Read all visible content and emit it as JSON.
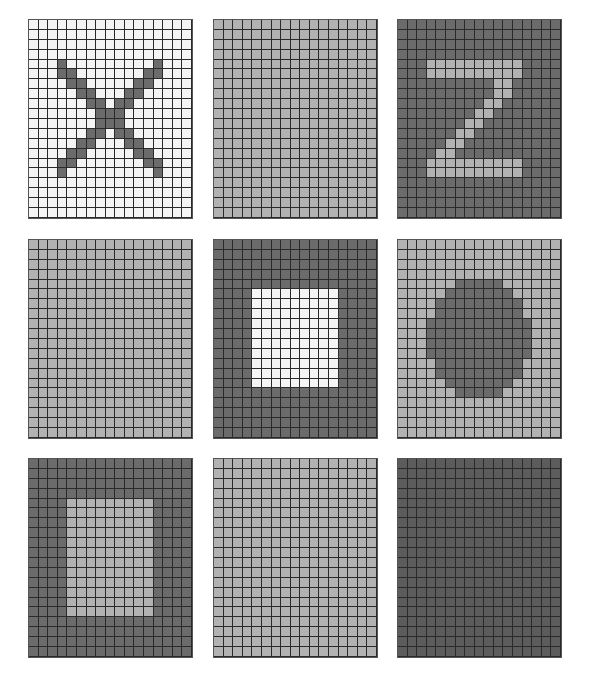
{
  "grid": {
    "cols": 17,
    "rows": 20
  },
  "colors": {
    "white": "#f4f4f4",
    "light": "#b2b2b2",
    "dark": "#6b6b6b",
    "darkest": "#5c5c5c"
  },
  "panels": [
    {
      "name": "panel-x-pattern",
      "left": 28,
      "top": 19,
      "bg": "white",
      "fg": "dark",
      "shape": "x",
      "cells": [
        [
          4,
          3
        ],
        [
          4,
          13
        ],
        [
          5,
          3
        ],
        [
          5,
          4
        ],
        [
          5,
          12
        ],
        [
          5,
          13
        ],
        [
          6,
          4
        ],
        [
          6,
          5
        ],
        [
          6,
          11
        ],
        [
          6,
          12
        ],
        [
          7,
          5
        ],
        [
          7,
          6
        ],
        [
          7,
          10
        ],
        [
          7,
          11
        ],
        [
          8,
          6
        ],
        [
          8,
          7
        ],
        [
          8,
          9
        ],
        [
          8,
          10
        ],
        [
          9,
          7
        ],
        [
          9,
          8
        ],
        [
          9,
          9
        ],
        [
          10,
          7
        ],
        [
          10,
          8
        ],
        [
          10,
          9
        ],
        [
          11,
          6
        ],
        [
          11,
          7
        ],
        [
          11,
          9
        ],
        [
          11,
          10
        ],
        [
          12,
          5
        ],
        [
          12,
          6
        ],
        [
          12,
          10
        ],
        [
          12,
          11
        ],
        [
          13,
          4
        ],
        [
          13,
          5
        ],
        [
          13,
          11
        ],
        [
          13,
          12
        ],
        [
          14,
          3
        ],
        [
          14,
          4
        ],
        [
          14,
          12
        ],
        [
          14,
          13
        ],
        [
          15,
          3
        ],
        [
          15,
          13
        ]
      ]
    },
    {
      "name": "panel-blank-light",
      "left": 213,
      "top": 19,
      "bg": "light",
      "fg": "light",
      "shape": "none",
      "cells": []
    },
    {
      "name": "panel-z-pattern",
      "left": 397,
      "top": 19,
      "bg": "dark",
      "fg": "light",
      "shape": "z",
      "rect_rows": [
        [
          4,
          3,
          12
        ],
        [
          5,
          3,
          12
        ],
        [
          14,
          3,
          12
        ],
        [
          15,
          3,
          12
        ]
      ],
      "cells": [
        [
          6,
          10
        ],
        [
          6,
          11
        ],
        [
          7,
          10
        ],
        [
          7,
          11
        ],
        [
          8,
          9
        ],
        [
          8,
          10
        ],
        [
          9,
          8
        ],
        [
          9,
          9
        ],
        [
          10,
          7
        ],
        [
          10,
          8
        ],
        [
          11,
          6
        ],
        [
          11,
          7
        ],
        [
          12,
          5
        ],
        [
          12,
          6
        ],
        [
          13,
          4
        ],
        [
          13,
          5
        ]
      ]
    },
    {
      "name": "panel-blank-light-2",
      "left": 28,
      "top": 239,
      "bg": "light",
      "fg": "light",
      "shape": "none",
      "cells": []
    },
    {
      "name": "panel-square-pattern",
      "left": 213,
      "top": 239,
      "bg": "dark",
      "fg": "white",
      "shape": "rect",
      "rect": {
        "r0": 5,
        "r1": 14,
        "c0": 4,
        "c1": 12
      },
      "cells": []
    },
    {
      "name": "panel-circle-pattern",
      "left": 397,
      "top": 239,
      "bg": "light",
      "fg": "dark",
      "shape": "circle",
      "rect_rows": [
        [
          4,
          6,
          10
        ],
        [
          5,
          5,
          11
        ],
        [
          6,
          4,
          12
        ],
        [
          7,
          4,
          12
        ],
        [
          8,
          3,
          13
        ],
        [
          9,
          3,
          13
        ],
        [
          10,
          3,
          13
        ],
        [
          11,
          3,
          13
        ],
        [
          12,
          4,
          12
        ],
        [
          13,
          4,
          12
        ],
        [
          14,
          5,
          11
        ],
        [
          15,
          6,
          10
        ]
      ],
      "cells": []
    },
    {
      "name": "panel-rect-pattern",
      "left": 28,
      "top": 458,
      "bg": "dark",
      "fg": "light",
      "shape": "rect",
      "rect": {
        "r0": 4,
        "r1": 15,
        "c0": 4,
        "c1": 12
      },
      "cells": []
    },
    {
      "name": "panel-blank-light-3",
      "left": 213,
      "top": 458,
      "bg": "light",
      "fg": "light",
      "shape": "none",
      "cells": []
    },
    {
      "name": "panel-blank-dark",
      "left": 397,
      "top": 458,
      "bg": "darkest",
      "fg": "darkest",
      "shape": "none",
      "cells": []
    }
  ]
}
